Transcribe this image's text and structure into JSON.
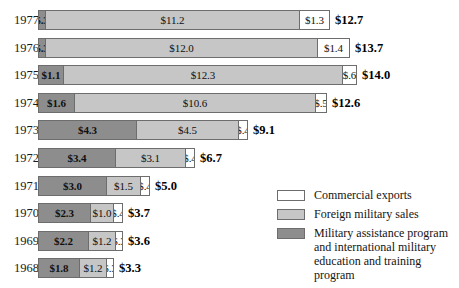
{
  "chart_data": {
    "type": "bar",
    "orientation": "horizontal",
    "stacked": true,
    "title": "",
    "xlabel": "",
    "ylabel": "",
    "xlim": [
      0,
      14.0
    ],
    "grid": false,
    "legend_position": "right",
    "categories": [
      "1977",
      "1976",
      "1975",
      "1974",
      "1973",
      "1972",
      "1971",
      "1970",
      "1969",
      "1968"
    ],
    "series": [
      {
        "name": "Military assistance program and international military education and training program",
        "color": "#8d8d8d",
        "values": [
          0.3,
          0.3,
          1.1,
          1.6,
          4.3,
          3.4,
          3.0,
          2.3,
          2.2,
          1.8
        ],
        "labels": [
          "$.3",
          "$.3",
          "$1.1",
          "$1.6",
          "$4.3",
          "$3.4",
          "$3.0",
          "$2.3",
          "$2.2",
          "$1.8"
        ]
      },
      {
        "name": "Foreign military sales",
        "color": "#c6c6c6",
        "values": [
          11.2,
          12.0,
          12.3,
          10.6,
          4.5,
          3.1,
          1.5,
          1.0,
          1.2,
          1.2
        ],
        "labels": [
          "$11.2",
          "$12.0",
          "$12.3",
          "$10.6",
          "$4.5",
          "$3.1",
          "$1.5",
          "$1.0",
          "$1.2",
          "$1.2"
        ]
      },
      {
        "name": "Commercial exports",
        "color": "#ffffff",
        "values": [
          1.3,
          1.4,
          0.6,
          0.5,
          0.4,
          0.4,
          0.4,
          0.4,
          0.3,
          0.3
        ],
        "labels": [
          "$1.3",
          "$1.4",
          "$.6",
          "$.5",
          "$.4",
          "$.4",
          "$.4",
          "$.4",
          "$.3",
          "$.3"
        ]
      }
    ],
    "totals": [
      12.7,
      13.7,
      14.0,
      12.6,
      9.1,
      6.7,
      5.0,
      3.7,
      3.6,
      3.3
    ],
    "total_labels": [
      "$12.7",
      "$13.7",
      "$14.0",
      "$12.6",
      "$9.1",
      "$6.7",
      "$5.0",
      "$3.7",
      "$3.6",
      "$3.3"
    ]
  },
  "legend": {
    "items": [
      {
        "label": "Commercial exports",
        "color": "#ffffff",
        "swatch_name": "legend-swatch-commercial-exports"
      },
      {
        "label": "Foreign military sales",
        "color": "#c6c6c6",
        "swatch_name": "legend-swatch-foreign-military-sales"
      },
      {
        "label": "Military assistance program and international military education and training program",
        "color": "#8d8d8d",
        "swatch_name": "legend-swatch-military-assistance"
      }
    ]
  },
  "caption": ""
}
